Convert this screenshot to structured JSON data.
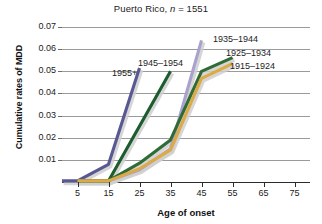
{
  "chart_data": {
    "type": "line",
    "title": "Puerto Rico, n = 1551",
    "title_prefix": "Puerto Rico, ",
    "title_italic": "n",
    "title_suffix": " = 1551",
    "xlabel": "Age of onset",
    "ylabel": "Cumulative rates of MDD",
    "x": [
      5,
      15,
      25,
      35,
      45,
      55,
      65,
      75
    ],
    "xticks": [
      "5",
      "15",
      "25",
      "35",
      "45",
      "55",
      "65",
      "75"
    ],
    "yticks": [
      "0.01",
      "0.02",
      "0.03",
      "0.04",
      "0.05",
      "0.06",
      "0.07"
    ],
    "ylim": [
      0,
      0.075
    ],
    "xlim": [
      0,
      80
    ],
    "grid": true,
    "legend": "inline-annotations",
    "series": [
      {
        "name": "1955+",
        "color": "#5a5894",
        "label_x": 112,
        "label_y": 68,
        "x": [
          0,
          5,
          15,
          25
        ],
        "values": [
          0.0005,
          0.0005,
          0.008,
          0.0515
        ]
      },
      {
        "name": "1945–1954",
        "color": "#1d5c2e",
        "label_x": 138,
        "label_y": 58,
        "x": [
          5,
          15,
          35
        ],
        "values": [
          0.0005,
          0.0005,
          0.05
        ]
      },
      {
        "name": "1935–1944",
        "color": "#a9a2cf",
        "label_x": 213,
        "label_y": 34,
        "x": [
          5,
          15,
          25,
          35,
          45
        ],
        "values": [
          0.0005,
          0.0005,
          0.0055,
          0.015,
          0.064
        ]
      },
      {
        "name": "1925–1934",
        "color": "#2f6b35",
        "label_x": 226,
        "label_y": 48,
        "x": [
          5,
          15,
          25,
          35,
          45,
          55
        ],
        "values": [
          0.0005,
          0.0005,
          0.0085,
          0.019,
          0.05,
          0.0562
        ]
      },
      {
        "name": "1915–1924",
        "color": "#dcaa46",
        "label_x": 230,
        "label_y": 61,
        "x": [
          5,
          15,
          25,
          35,
          45,
          55
        ],
        "values": [
          0.0005,
          0.0005,
          0.006,
          0.0145,
          0.0468,
          0.0535
        ]
      }
    ]
  }
}
